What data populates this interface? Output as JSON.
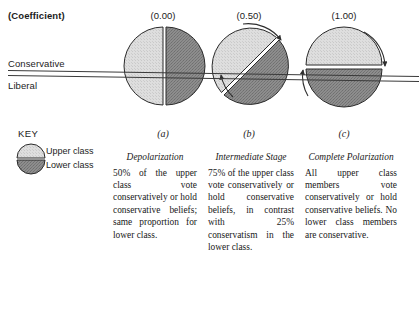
{
  "figure": {
    "coefficient_label": "(Coefficient)",
    "axis": {
      "conservative": "Conservative",
      "liberal": "Liberal"
    },
    "key": {
      "title": "KEY",
      "upper_class": "Upper class",
      "lower_class": "Lower class"
    },
    "colors": {
      "upper_class_fill": "#d9d9d9",
      "lower_class_fill": "#8a8a8a",
      "outline": "#2a2a2a",
      "line": "#3a3a3a",
      "text": "#1c1c1c"
    },
    "panels": [
      {
        "coefficient": "(0.00)",
        "letter": "(a)",
        "title": "Depolarization",
        "body": "50% of the upper class vote conservatively or hold conservative beliefs; same proportion for lower class.",
        "split": "vertical",
        "upper_conservative_pct": 50,
        "lower_conservative_pct": 50
      },
      {
        "coefficient": "(0.50)",
        "letter": "(b)",
        "title": "Intermediate Stage",
        "body": "75% of the upper class vote conservatively or hold conservative beliefs, in contrast with 25% conservatism in the lower class.",
        "split": "diagonal",
        "upper_conservative_pct": 75,
        "lower_conservative_pct": 25
      },
      {
        "coefficient": "(1.00)",
        "letter": "(c)",
        "title": "Complete Polarization",
        "body": "All upper class members vote conservatively or hold conservative beliefs. No lower class members are conservative.",
        "split": "horizontal",
        "upper_conservative_pct": 100,
        "lower_conservative_pct": 0
      }
    ]
  }
}
